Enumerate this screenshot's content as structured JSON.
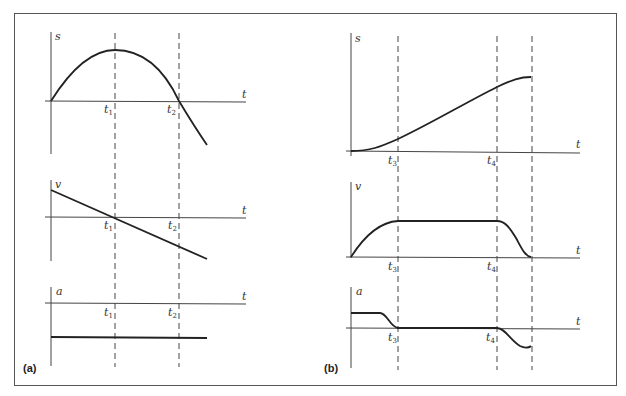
{
  "figure": {
    "panels": [
      {
        "id": "a",
        "label": "(a)",
        "time_markers": [
          {
            "name": "t",
            "sub": "1"
          },
          {
            "name": "t",
            "sub": "2"
          }
        ],
        "graphs": [
          {
            "y_label": "s",
            "x_label": "t",
            "shape": "parabola rising from origin, peak at t1, crossing zero at t2, continuing negative"
          },
          {
            "y_label": "v",
            "x_label": "t",
            "shape": "straight line decreasing, crossing zero at t1"
          },
          {
            "y_label": "a",
            "x_label": "t",
            "shape": "constant negative value"
          }
        ]
      },
      {
        "id": "b",
        "label": "(b)",
        "time_markers": [
          {
            "name": "t",
            "sub": "3"
          },
          {
            "name": "t",
            "sub": "4"
          },
          {
            "name": "",
            "sub": ""
          }
        ],
        "graphs": [
          {
            "y_label": "s",
            "x_label": "t",
            "shape": "S-curve rising from zero, leveling off at end"
          },
          {
            "y_label": "v",
            "x_label": "t",
            "shape": "rise to plateau at t3, constant until t4, fall to zero at end"
          },
          {
            "y_label": "a",
            "x_label": "t",
            "shape": "positive constant then fall to zero at t3, zero until t4, negative dip before end"
          }
        ]
      }
    ]
  }
}
